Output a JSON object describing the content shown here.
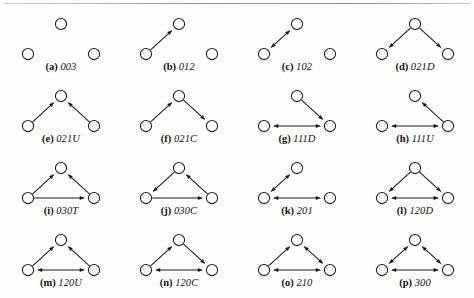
{
  "figure": {
    "columns": 4,
    "rows": 4,
    "node_layout": {
      "top": {
        "x": 59,
        "y": 16
      },
      "left": {
        "x": 26,
        "y": 46
      },
      "right": {
        "x": 92,
        "y": 46
      },
      "radius": 5.6
    },
    "style": {
      "node_fill": "#ffffff",
      "node_stroke": "#1a1a1a",
      "edge_color": "#1a1a1a",
      "background": "#fdfdfc",
      "rule_color": "#9a9a9a"
    }
  },
  "panels": [
    {
      "id": "a",
      "tag": "(a)",
      "code": "003",
      "nodes": [
        "top",
        "left",
        "right"
      ],
      "edges": []
    },
    {
      "id": "b",
      "tag": "(b)",
      "code": "012",
      "nodes": [
        "top",
        "left",
        "right"
      ],
      "edges": [
        {
          "from": "left",
          "to": "top",
          "type": "asymmetric"
        }
      ]
    },
    {
      "id": "c",
      "tag": "(c)",
      "code": "102",
      "nodes": [
        "top",
        "left",
        "right"
      ],
      "edges": [
        {
          "from": "left",
          "to": "top",
          "type": "mutual"
        }
      ]
    },
    {
      "id": "d",
      "tag": "(d)",
      "code": "021D",
      "nodes": [
        "top",
        "left",
        "right"
      ],
      "edges": [
        {
          "from": "top",
          "to": "left",
          "type": "asymmetric"
        },
        {
          "from": "top",
          "to": "right",
          "type": "asymmetric"
        }
      ]
    },
    {
      "id": "e",
      "tag": "(e)",
      "code": "021U",
      "nodes": [
        "top",
        "left",
        "right"
      ],
      "edges": [
        {
          "from": "left",
          "to": "top",
          "type": "asymmetric"
        },
        {
          "from": "right",
          "to": "top",
          "type": "asymmetric"
        }
      ]
    },
    {
      "id": "f",
      "tag": "(f)",
      "code": "021C",
      "nodes": [
        "top",
        "left",
        "right"
      ],
      "edges": [
        {
          "from": "left",
          "to": "top",
          "type": "asymmetric"
        },
        {
          "from": "top",
          "to": "right",
          "type": "asymmetric"
        }
      ]
    },
    {
      "id": "g",
      "tag": "(g)",
      "code": "111D",
      "nodes": [
        "top",
        "left",
        "right"
      ],
      "edges": [
        {
          "from": "top",
          "to": "right",
          "type": "asymmetric"
        },
        {
          "from": "right",
          "to": "left",
          "type": "mutual"
        }
      ]
    },
    {
      "id": "h",
      "tag": "(h)",
      "code": "111U",
      "nodes": [
        "top",
        "left",
        "right"
      ],
      "edges": [
        {
          "from": "right",
          "to": "top",
          "type": "asymmetric"
        },
        {
          "from": "right",
          "to": "left",
          "type": "mutual"
        }
      ]
    },
    {
      "id": "i",
      "tag": "(i)",
      "code": "030T",
      "nodes": [
        "top",
        "left",
        "right"
      ],
      "edges": [
        {
          "from": "left",
          "to": "top",
          "type": "asymmetric"
        },
        {
          "from": "right",
          "to": "top",
          "type": "asymmetric"
        },
        {
          "from": "left",
          "to": "right",
          "type": "asymmetric"
        }
      ]
    },
    {
      "id": "j",
      "tag": "(j)",
      "code": "030C",
      "nodes": [
        "top",
        "left",
        "right"
      ],
      "edges": [
        {
          "from": "top",
          "to": "left",
          "type": "asymmetric"
        },
        {
          "from": "left",
          "to": "right",
          "type": "asymmetric"
        },
        {
          "from": "right",
          "to": "top",
          "type": "asymmetric"
        }
      ]
    },
    {
      "id": "k",
      "tag": "(k)",
      "code": "201",
      "nodes": [
        "top",
        "left",
        "right"
      ],
      "edges": [
        {
          "from": "left",
          "to": "top",
          "type": "mutual"
        },
        {
          "from": "left",
          "to": "right",
          "type": "mutual"
        }
      ]
    },
    {
      "id": "l",
      "tag": "(l)",
      "code": "120D",
      "nodes": [
        "top",
        "left",
        "right"
      ],
      "edges": [
        {
          "from": "top",
          "to": "left",
          "type": "asymmetric"
        },
        {
          "from": "top",
          "to": "right",
          "type": "asymmetric"
        },
        {
          "from": "left",
          "to": "right",
          "type": "mutual"
        }
      ]
    },
    {
      "id": "m",
      "tag": "(m)",
      "code": "120U",
      "nodes": [
        "top",
        "left",
        "right"
      ],
      "edges": [
        {
          "from": "left",
          "to": "top",
          "type": "asymmetric"
        },
        {
          "from": "right",
          "to": "top",
          "type": "asymmetric"
        },
        {
          "from": "left",
          "to": "right",
          "type": "mutual"
        }
      ]
    },
    {
      "id": "n",
      "tag": "(n)",
      "code": "120C",
      "nodes": [
        "top",
        "left",
        "right"
      ],
      "edges": [
        {
          "from": "left",
          "to": "top",
          "type": "asymmetric"
        },
        {
          "from": "top",
          "to": "right",
          "type": "asymmetric"
        },
        {
          "from": "left",
          "to": "right",
          "type": "mutual"
        }
      ]
    },
    {
      "id": "o",
      "tag": "(o)",
      "code": "210",
      "nodes": [
        "top",
        "left",
        "right"
      ],
      "edges": [
        {
          "from": "left",
          "to": "top",
          "type": "asymmetric"
        },
        {
          "from": "top",
          "to": "right",
          "type": "mutual"
        },
        {
          "from": "left",
          "to": "right",
          "type": "mutual"
        }
      ]
    },
    {
      "id": "p",
      "tag": "(p)",
      "code": "300",
      "nodes": [
        "top",
        "left",
        "right"
      ],
      "edges": [
        {
          "from": "left",
          "to": "top",
          "type": "mutual"
        },
        {
          "from": "top",
          "to": "right",
          "type": "mutual"
        },
        {
          "from": "left",
          "to": "right",
          "type": "mutual"
        }
      ]
    }
  ]
}
